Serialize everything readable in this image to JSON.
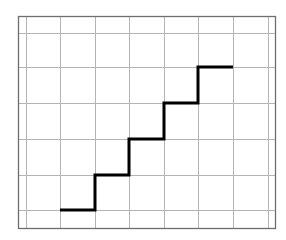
{
  "diagram": {
    "type": "staircase-on-grid",
    "colors": {
      "background": "#ffffff",
      "grid": "#b4b4b4",
      "border": "#6e6e6e",
      "staircase": "#000000"
    },
    "frame": {
      "x": 18,
      "y": 16,
      "width": 257,
      "height": 212
    },
    "grid": {
      "vertical_x": [
        26,
        60,
        95,
        129,
        164,
        198,
        233,
        268
      ],
      "horizontal_y": [
        33,
        67,
        103,
        139,
        175,
        210
      ]
    },
    "staircase": {
      "points": [
        [
          60,
          210
        ],
        [
          95,
          210
        ],
        [
          95,
          175
        ],
        [
          129,
          175
        ],
        [
          129,
          139
        ],
        [
          164,
          139
        ],
        [
          164,
          103
        ],
        [
          198,
          103
        ],
        [
          198,
          67
        ],
        [
          233,
          67
        ]
      ],
      "steps": 5,
      "stroke_width": 3
    }
  }
}
